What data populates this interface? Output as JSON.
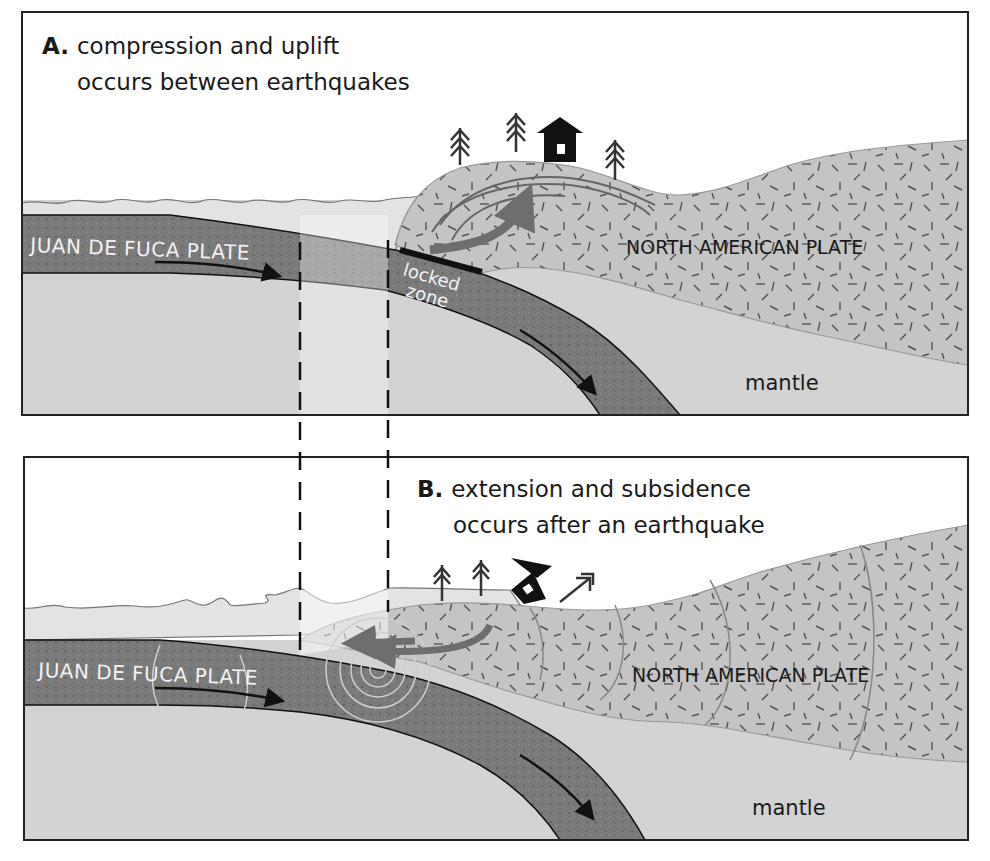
{
  "panel_a": {
    "letter": "A.",
    "caption_line1": "compression and uplift",
    "caption_line2": "occurs between earthquakes",
    "oceanic_plate_label": "JUAN DE FUCA PLATE",
    "continental_plate_label": "NORTH AMERICAN PLATE",
    "mantle_label": "mantle",
    "locked_zone_label_line1": "locked",
    "locked_zone_label_line2": "zone",
    "icons": [
      "tree-icon",
      "tree-icon",
      "house-icon",
      "tree-icon"
    ]
  },
  "panel_b": {
    "letter": "B.",
    "caption_line1": "extension and subsidence",
    "caption_line2": "occurs after an earthquake",
    "oceanic_plate_label": "JUAN DE FUCA PLATE",
    "continental_plate_label": "NORTH AMERICAN PLATE",
    "mantle_label": "mantle",
    "icons": [
      "tree-icon",
      "tree-icon",
      "tilted-house-icon",
      "fallen-tree-icon",
      "seismic-wave-rings"
    ]
  },
  "colors": {
    "ocean": "#e3e3e3",
    "oceanic_plate": "#7a7a7a",
    "continental_plate": "#c4c4c4",
    "mantle": "#d3d3d3",
    "arrow_gray": "#6e6e6e",
    "arrow_black": "#111111",
    "border": "#222222"
  }
}
